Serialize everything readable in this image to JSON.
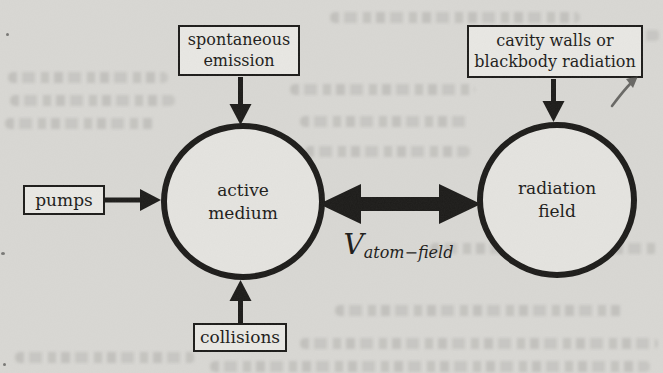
{
  "figure": {
    "colors": {
      "ink": "#1c1b19",
      "paper": "#d9d8d4",
      "box_fill": "#e9e8e4"
    },
    "nodes": {
      "active_medium": {
        "lines": [
          "active",
          "medium"
        ]
      },
      "radiation_field": {
        "lines": [
          "radiation",
          "field"
        ]
      }
    },
    "sources": {
      "spontaneous_emission": {
        "lines": [
          "spontaneous",
          "emission"
        ]
      },
      "cavity_walls": {
        "lines": [
          "cavity walls or",
          "blackbody radiation"
        ]
      },
      "pumps": {
        "label": "pumps"
      },
      "collisions": {
        "label": "collisions"
      }
    },
    "coupling": {
      "symbol": "V",
      "subscript": "atom−field"
    }
  }
}
